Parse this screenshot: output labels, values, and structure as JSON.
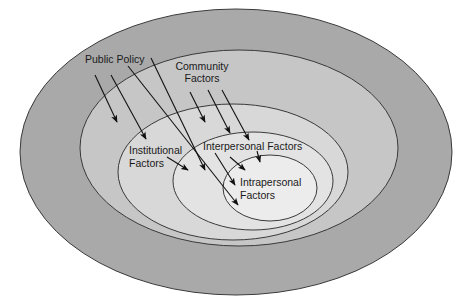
{
  "diagram": {
    "type": "nested-ellipses",
    "levels": [
      {
        "id": "public-policy",
        "label": "Public Policy",
        "fill": "#a9a9a9",
        "cx": 236,
        "cy": 152,
        "rx": 216,
        "ry": 143
      },
      {
        "id": "community",
        "label_lines": [
          "Community",
          "Factors"
        ],
        "fill": "#c6c6c6",
        "cx": 239,
        "cy": 148,
        "rx": 159,
        "ry": 98
      },
      {
        "id": "institutional",
        "label_lines": [
          "Institutional",
          "Factors"
        ],
        "fill": "#d8d8d8",
        "cx": 233,
        "cy": 172,
        "rx": 115,
        "ry": 68
      },
      {
        "id": "interpersonal",
        "label": "Interpersonal Factors",
        "fill": "#e3e3e3",
        "cx": 253,
        "cy": 181,
        "rx": 80,
        "ry": 49
      },
      {
        "id": "intrapersonal",
        "label_lines": [
          "Intrapersonal",
          "Factors"
        ],
        "fill": "#ececec",
        "cx": 270,
        "cy": 188,
        "rx": 47,
        "ry": 33
      }
    ],
    "labels": {
      "public_policy": "Public Policy",
      "community_1": "Community",
      "community_2": "Factors",
      "institutional_1": "Institutional",
      "institutional_2": "Factors",
      "interpersonal": "Interpersonal Factors",
      "intrapersonal_1": "Intrapersonal",
      "intrapersonal_2": "Factors"
    },
    "arrows": [
      {
        "from": "public-policy",
        "x1": 95,
        "y1": 75,
        "x2": 117,
        "y2": 122
      },
      {
        "from": "public-policy",
        "x1": 111,
        "y1": 75,
        "x2": 146,
        "y2": 139
      },
      {
        "from": "public-policy",
        "x1": 128,
        "y1": 66,
        "x2": 238,
        "y2": 205
      },
      {
        "from": "public-policy",
        "x1": 151,
        "y1": 58,
        "x2": 205,
        "y2": 170
      },
      {
        "from": "community",
        "x1": 190,
        "y1": 92,
        "x2": 205,
        "y2": 122
      },
      {
        "from": "community",
        "x1": 208,
        "y1": 90,
        "x2": 230,
        "y2": 133
      },
      {
        "from": "community",
        "x1": 222,
        "y1": 90,
        "x2": 249,
        "y2": 140
      },
      {
        "from": "institutional",
        "x1": 167,
        "y1": 157,
        "x2": 188,
        "y2": 170
      },
      {
        "from": "interpersonal",
        "x1": 215,
        "y1": 153,
        "x2": 235,
        "y2": 185
      },
      {
        "from": "interpersonal",
        "x1": 230,
        "y1": 157,
        "x2": 245,
        "y2": 170
      },
      {
        "from": "interpersonal",
        "x1": 257,
        "y1": 151,
        "x2": 260,
        "y2": 162
      }
    ],
    "colors": {
      "stroke": "#3a3a3a",
      "arrow": "#111111",
      "text": "#1a1a1a",
      "background": "#ffffff"
    }
  }
}
